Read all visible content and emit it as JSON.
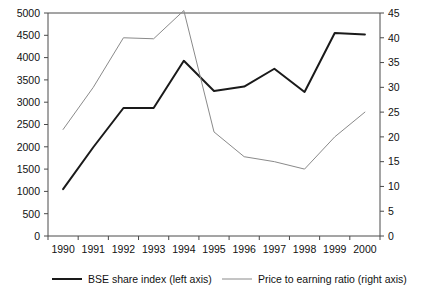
{
  "chart_data": {
    "type": "line",
    "title": "",
    "xlabel": "",
    "categories": [
      "1990",
      "1991",
      "1992",
      "1993",
      "1994",
      "1995",
      "1996",
      "1997",
      "1998",
      "1999",
      "2000"
    ],
    "grid": false,
    "legend_position": "bottom",
    "axes": {
      "left": {
        "label": "BSE share index (left axis)",
        "ylim": [
          0,
          5000
        ],
        "ticks": [
          0,
          500,
          1000,
          1500,
          2000,
          2500,
          3000,
          3500,
          4000,
          4500,
          5000
        ],
        "tick_labels": [
          "0",
          "500",
          "1000",
          "1500",
          "2000",
          "2500",
          "3000",
          "3500",
          "4000",
          "4500",
          "5000"
        ]
      },
      "right": {
        "label": "Price to earning ratio (right axis)",
        "ylim": [
          0,
          45
        ],
        "ticks": [
          0,
          5,
          10,
          15,
          20,
          25,
          30,
          35,
          40,
          45
        ],
        "tick_labels": [
          "0",
          "5",
          "10",
          "15",
          "20",
          "25",
          "30",
          "35",
          "40",
          "45"
        ]
      }
    },
    "series": [
      {
        "name": "BSE share index (left axis)",
        "axis": "left",
        "color": "#1a1a1a",
        "width": 2,
        "values": [
          1050,
          1990,
          2870,
          2870,
          3930,
          3250,
          3350,
          3750,
          3230,
          4550,
          4520
        ]
      },
      {
        "name": "Price to earning ratio (right axis)",
        "axis": "right",
        "color": "#8a8a8a",
        "width": 1,
        "values": [
          21.5,
          30.0,
          40.0,
          39.8,
          45.5,
          21.0,
          16.0,
          15.0,
          13.5,
          20.0,
          25.0
        ]
      }
    ],
    "legend": [
      {
        "label": "BSE share index (left axis)",
        "color": "#1a1a1a",
        "width": 2
      },
      {
        "label": "Price to earning ratio (right axis)",
        "color": "#8a8a8a",
        "width": 1
      }
    ]
  }
}
